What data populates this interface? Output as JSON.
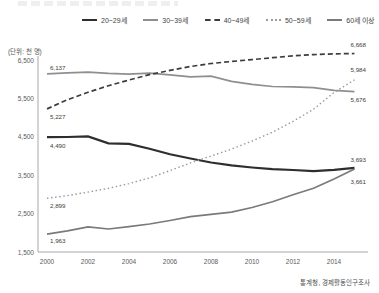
{
  "unit_label": "(단위: 천 명)",
  "source": "통계청, 경제활동인구조사",
  "chart_data": {
    "type": "line",
    "title": "",
    "xlabel": "",
    "ylabel": "(단위: 천 명)",
    "x": [
      2000,
      2001,
      2002,
      2003,
      2004,
      2005,
      2006,
      2007,
      2008,
      2009,
      2010,
      2011,
      2012,
      2013,
      2014,
      2015
    ],
    "x_ticks": [
      {
        "label": "2000",
        "value": 2000
      },
      {
        "label": "2002",
        "value": 2002
      },
      {
        "label": "2004",
        "value": 2004
      },
      {
        "label": "2006",
        "value": 2006
      },
      {
        "label": "2008",
        "value": 2008
      },
      {
        "label": "2010",
        "value": 2010
      },
      {
        "label": "2012",
        "value": 2012
      },
      {
        "label": "2014",
        "value": 2014
      }
    ],
    "ylim": [
      1500,
      6500
    ],
    "y_ticks": [
      {
        "label": "6,500",
        "value": 6500
      },
      {
        "label": "5,500",
        "value": 5500
      },
      {
        "label": "4,500",
        "value": 4500
      },
      {
        "label": "3,500",
        "value": 3500
      },
      {
        "label": "2,500",
        "value": 2500
      },
      {
        "label": "1,500",
        "value": 1500
      }
    ],
    "grid": false,
    "legend_position": "top",
    "series": [
      {
        "name": "20~29세",
        "style": "solid",
        "color": "#2e2e2e",
        "width": 2.2,
        "values": [
          4490,
          4495,
          4510,
          4330,
          4315,
          4190,
          4045,
          3935,
          3830,
          3755,
          3700,
          3655,
          3635,
          3605,
          3640,
          3693
        ],
        "start_label": "4,490",
        "start_dy": 11,
        "end_label": "3,693",
        "end_dy": -6
      },
      {
        "name": "30~39세",
        "style": "solid",
        "color": "#8f8f8f",
        "width": 1.7,
        "values": [
          6137,
          6165,
          6185,
          6150,
          6130,
          6160,
          6115,
          6060,
          6080,
          5945,
          5865,
          5810,
          5800,
          5780,
          5710,
          5676
        ],
        "start_label": "6,137",
        "start_dy": -4,
        "end_label": "5,676",
        "end_dy": 10
      },
      {
        "name": "40~49세",
        "style": "dashed",
        "color": "#3c3c3c",
        "width": 1.7,
        "values": [
          5227,
          5465,
          5660,
          5830,
          5980,
          6120,
          6230,
          6330,
          6410,
          6460,
          6510,
          6560,
          6610,
          6640,
          6660,
          6668
        ],
        "start_label": "5,227",
        "start_dy": 10,
        "end_label": "6,668",
        "end_dy": -7
      },
      {
        "name": "50~59세",
        "style": "dotted",
        "color": "#9a9a9a",
        "width": 1.4,
        "values": [
          2899,
          2970,
          3060,
          3160,
          3280,
          3430,
          3620,
          3820,
          4000,
          4180,
          4390,
          4620,
          4900,
          5220,
          5650,
          5984
        ],
        "start_label": "2,899",
        "start_dy": 10,
        "end_label": "5,984",
        "end_dy": -8
      },
      {
        "name": "60세 이상",
        "style": "solid",
        "color": "#7a7a7a",
        "width": 1.7,
        "values": [
          1963,
          2050,
          2155,
          2100,
          2160,
          2230,
          2320,
          2420,
          2480,
          2540,
          2660,
          2810,
          2990,
          3160,
          3400,
          3661
        ],
        "start_label": "1,963",
        "start_dy": 9,
        "end_label": "3,661",
        "end_dy": 15
      }
    ]
  }
}
